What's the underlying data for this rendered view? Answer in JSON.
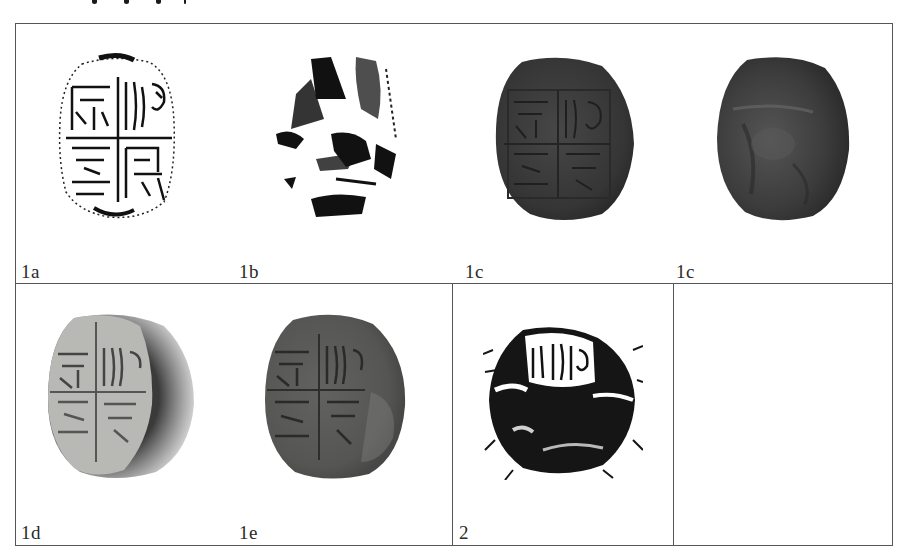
{
  "figure": {
    "type": "archaeological-plate",
    "border_color": "#555555",
    "rows": [
      {
        "panels": [
          {
            "id": "1a",
            "label": "1a",
            "kind": "rubbing",
            "description": "Ink rubbing of four-character square seal face (two rows, two columns, cross divider)"
          },
          {
            "id": "1b",
            "label": "1b",
            "kind": "rubbing",
            "description": "Ink rubbing of reverse side, fragmentary"
          },
          {
            "id": "1c-obverse",
            "label": "1c",
            "kind": "photo",
            "description": "Photograph of dark seal, inscribed face"
          },
          {
            "id": "1c-reverse",
            "label": "1c",
            "kind": "photo",
            "description": "Photograph of dark seal, reverse side"
          }
        ]
      },
      {
        "panels": [
          {
            "id": "1d",
            "label": "1d",
            "kind": "photo",
            "description": "Photograph of seal face under raking light, light-grey with dark crescent edge"
          },
          {
            "id": "1e",
            "label": "1e",
            "kind": "photo",
            "description": "Photograph of seal face, medium-grey tone"
          },
          {
            "id": "2",
            "label": "2",
            "kind": "rubbing",
            "description": "Ink rubbing of second seal, partially legible upper register"
          },
          {
            "id": "empty",
            "label": "",
            "kind": "empty",
            "description": ""
          }
        ]
      }
    ],
    "colors": {
      "rubbing_ink": "#111111",
      "seal_dark": "#3a3a3a",
      "seal_light": "#b5b5b2",
      "seal_mid": "#5c5c5a"
    }
  }
}
